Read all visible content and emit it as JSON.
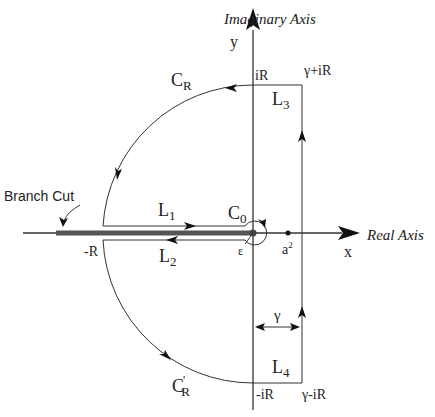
{
  "diagram": {
    "axes": {
      "imaginary_axis_label": "Imaginary Axis",
      "real_axis_label": "Real Axis",
      "y_label": "y",
      "x_label": "x"
    },
    "points": {
      "top_left": "iR",
      "top_right": "γ+iR",
      "bottom_left": "-iR",
      "bottom_right": "γ-iR",
      "neg_R": "-R",
      "a_squared_base": "a",
      "a_squared_sup": "2",
      "epsilon": "ε"
    },
    "contour_labels": {
      "C_R_base": "C",
      "C_R_sub": "R",
      "C_R_prime_base": "C",
      "C_R_prime_mark": "'",
      "C_R_prime_sub": "R",
      "C_0_base": "C",
      "C_0_sub": "0",
      "L1_base": "L",
      "L1_sub": "1",
      "L2_base": "L",
      "L2_sub": "2",
      "L3_base": "L",
      "L3_sub": "3",
      "L4_base": "L",
      "L4_sub": "4",
      "gamma": "γ"
    },
    "annotations": {
      "branch_cut": "Branch Cut"
    },
    "colors": {
      "line": "#333333",
      "branch_cut": "#555555",
      "background": "#ffffff"
    }
  }
}
